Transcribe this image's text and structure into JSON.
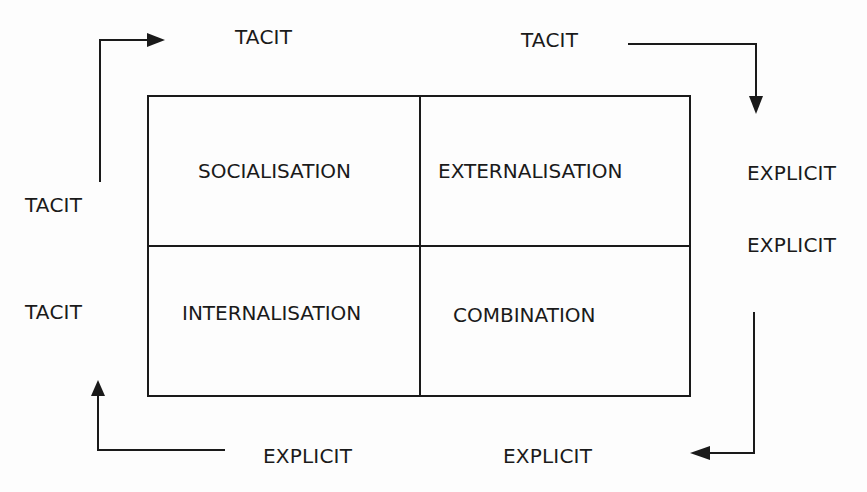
{
  "diagram": {
    "type": "SECI knowledge conversion matrix",
    "quadrants": [
      {
        "id": "top-left",
        "label": "SOCIALISATION"
      },
      {
        "id": "top-right",
        "label": "EXTERNALISATION"
      },
      {
        "id": "bottom-left",
        "label": "INTERNALISATION"
      },
      {
        "id": "bottom-right",
        "label": "COMBINATION"
      }
    ],
    "axis_labels": {
      "top_left": "TACIT",
      "top_right": "TACIT",
      "left_top": "TACIT",
      "left_bottom": "TACIT",
      "right_top": "EXPLICIT",
      "right_bottom": "EXPLICIT",
      "bottom_right": "EXPLICIT",
      "bottom_left": "EXPLICIT"
    },
    "arrows": [
      {
        "from": "left_top TACIT",
        "to": "top_left TACIT",
        "direction": "up-then-right"
      },
      {
        "from": "top_right TACIT",
        "to": "right_top EXPLICIT",
        "direction": "right-then-down"
      },
      {
        "from": "right_bottom EXPLICIT",
        "to": "bottom_right EXPLICIT",
        "direction": "down-then-left"
      },
      {
        "from": "bottom_left EXPLICIT",
        "to": "left_bottom TACIT",
        "direction": "left-then-up"
      }
    ],
    "colors": {
      "line": "#1a1a1a",
      "background": "#fdfdfd"
    }
  }
}
